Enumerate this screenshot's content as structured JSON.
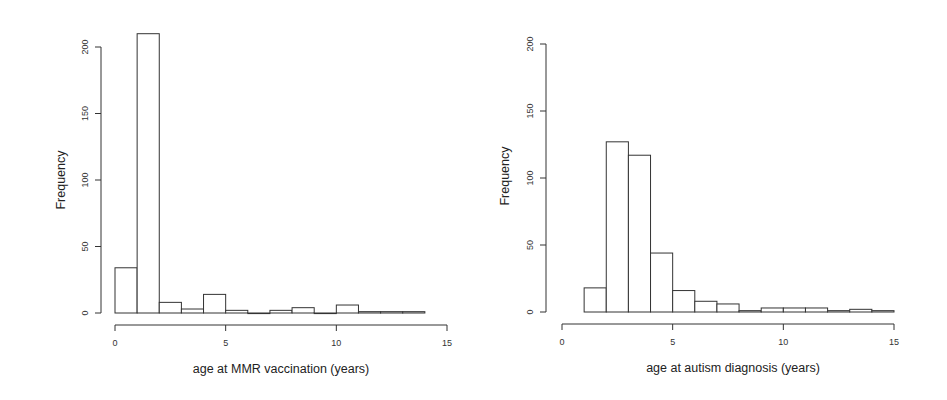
{
  "chart_data": [
    {
      "type": "bar",
      "subtype": "histogram",
      "title": "",
      "xlabel": "age at MMR vaccination (years)",
      "ylabel": "Frequency",
      "xlim": [
        0,
        15
      ],
      "ylim": [
        0,
        200
      ],
      "xticks": [
        "0",
        "5",
        "10",
        "15"
      ],
      "yticks": [
        "0",
        "50",
        "100",
        "150",
        "200"
      ],
      "bins": [
        [
          0,
          1
        ],
        [
          1,
          2
        ],
        [
          2,
          3
        ],
        [
          3,
          4
        ],
        [
          4,
          5
        ],
        [
          5,
          6
        ],
        [
          6,
          7
        ],
        [
          7,
          8
        ],
        [
          8,
          9
        ],
        [
          9,
          10
        ],
        [
          10,
          11
        ],
        [
          11,
          12
        ],
        [
          12,
          13
        ],
        [
          13,
          14
        ]
      ],
      "values": [
        34,
        210,
        8,
        3,
        14,
        2,
        0,
        2,
        4,
        0,
        6,
        1,
        1,
        1
      ],
      "grid": false
    },
    {
      "type": "bar",
      "subtype": "histogram",
      "title": "",
      "xlabel": "age at autism diagnosis (years)",
      "ylabel": "Frequency",
      "xlim": [
        0,
        15
      ],
      "ylim": [
        0,
        200
      ],
      "xticks": [
        "0",
        "5",
        "10",
        "15"
      ],
      "yticks": [
        "0",
        "50",
        "100",
        "150",
        "200"
      ],
      "bins": [
        [
          1,
          2
        ],
        [
          2,
          3
        ],
        [
          3,
          4
        ],
        [
          4,
          5
        ],
        [
          5,
          6
        ],
        [
          6,
          7
        ],
        [
          7,
          8
        ],
        [
          8,
          9
        ],
        [
          9,
          10
        ],
        [
          10,
          11
        ],
        [
          11,
          12
        ],
        [
          12,
          13
        ],
        [
          13,
          14
        ],
        [
          14,
          15
        ]
      ],
      "values": [
        18,
        127,
        117,
        44,
        16,
        8,
        6,
        1,
        3,
        3,
        3,
        1,
        2,
        1
      ],
      "grid": false
    }
  ]
}
